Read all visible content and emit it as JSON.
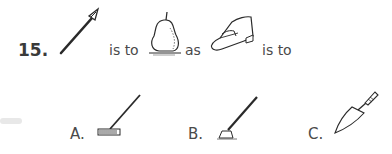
{
  "question": {
    "number": "15.",
    "connectors": [
      "is to",
      "as",
      "is to"
    ],
    "items": [
      {
        "icon": "spear-icon",
        "label": "spear"
      },
      {
        "icon": "pear-icon",
        "label": "pear"
      },
      {
        "icon": "shoe-icon",
        "label": "loafer shoe"
      }
    ]
  },
  "options": [
    {
      "letter": "A.",
      "icon": "rake-icon",
      "label": "rake"
    },
    {
      "letter": "B.",
      "icon": "hoe-icon",
      "label": "hoe"
    },
    {
      "letter": "C.",
      "icon": "trowel-icon",
      "label": "trowel"
    }
  ]
}
